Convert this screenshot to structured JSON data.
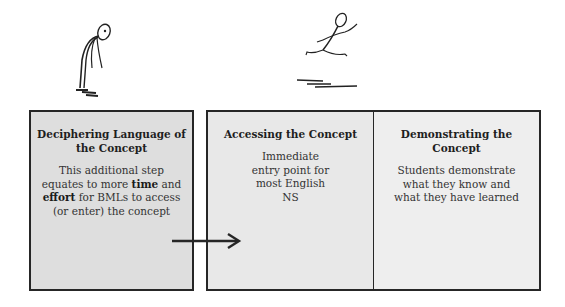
{
  "figures": [
    {
      "name": "tired-stick-figure",
      "description": "slumped standing stick figure"
    },
    {
      "name": "leaping-stick-figure",
      "description": "running/leaping stick figure"
    }
  ],
  "boxes": [
    {
      "title": "Deciphering Language of the Concept",
      "body_parts": [
        "This additional step equates to more ",
        "time",
        " and ",
        "effort",
        " for BMLs to access (or enter) the concept"
      ]
    },
    {
      "title": "Accessing the Concept",
      "body": "Immediate entry point for most English NS"
    },
    {
      "title": "Demonstrating the Concept",
      "body": "Students demonstrate what they know and what they have learned"
    }
  ],
  "arrow": {
    "direction": "right",
    "from": "box-1",
    "to": "box-2"
  },
  "colors": {
    "border": "#262626",
    "box_fill": "#e4e4e4",
    "background": "#ffffff"
  }
}
